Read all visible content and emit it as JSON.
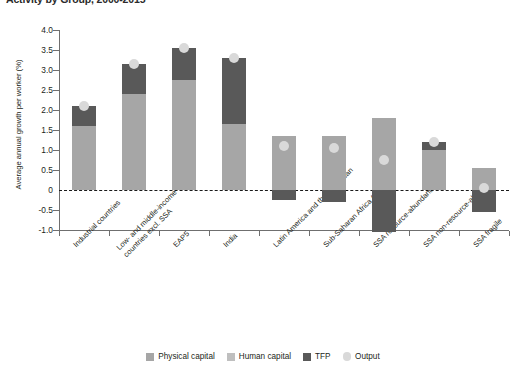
{
  "chart_data": {
    "type": "bar",
    "title": "Activity by Group, 2000-2015",
    "subtitle": "",
    "xlabel": "",
    "ylabel": "Average annual growth per worker (%)",
    "ylim": [
      -1.0,
      4.0
    ],
    "ytick_labels": [
      "4.0",
      "3.5",
      "3.0",
      "2.5",
      "2.0",
      "1.5",
      "1.0",
      "0.5",
      "0",
      "-0.5",
      "-1.0"
    ],
    "ytick_values": [
      4.0,
      3.5,
      3.0,
      2.5,
      2.0,
      1.5,
      1.0,
      0.5,
      0,
      -0.5,
      -1.0
    ],
    "grid": false,
    "zero_line": true,
    "stacked": true,
    "legend_position": "bottom",
    "categories": [
      "Industrial countries",
      "Low- and middle-income countries excl. SSA",
      "EAP5",
      "India",
      "Latin America and the Caribbean",
      "Sub-Saharan Africa (SSA)",
      "SSA resource-abundant",
      "SSA non-resource-abundant",
      "SSA fragile"
    ],
    "category_label_lines": [
      [
        "Industrial countries"
      ],
      [
        "Low- and middle-income",
        "countries excl. SSA"
      ],
      [
        "EAP5"
      ],
      [
        "India"
      ],
      [
        "Latin America and the Caribbean"
      ],
      [
        "Sub-Saharan Africa (SSA)"
      ],
      [
        "SSA resource-abundant"
      ],
      [
        "SSA non-resource-abundant"
      ],
      [
        "SSA fragile"
      ]
    ],
    "series": [
      {
        "name": "Physical capital",
        "color": "#a6a6a6",
        "values": [
          1.6,
          2.4,
          2.75,
          1.65,
          1.35,
          1.35,
          1.8,
          1.0,
          0.55
        ]
      },
      {
        "name": "Human capital",
        "color": "#bfbfbf",
        "values": [
          0,
          0,
          0,
          0,
          0,
          0,
          0,
          0,
          0
        ]
      },
      {
        "name": "TFP",
        "color": "#595959",
        "values": [
          0.5,
          0.75,
          0.8,
          1.65,
          -0.25,
          -0.3,
          -1.05,
          0.2,
          -0.55
        ]
      }
    ],
    "output_marker": {
      "name": "Output",
      "color": "#d9d9d9",
      "values": [
        2.1,
        3.15,
        3.55,
        3.3,
        1.1,
        1.05,
        0.75,
        1.2,
        0.05
      ]
    }
  },
  "legend": {
    "items": [
      {
        "label": "Physical capital",
        "color": "#a6a6a6",
        "shape": "square"
      },
      {
        "label": "Human capital",
        "color": "#bfbfbf",
        "shape": "square"
      },
      {
        "label": "TFP",
        "color": "#595959",
        "shape": "square"
      },
      {
        "label": "Output",
        "color": "#d9d9d9",
        "shape": "circle"
      }
    ]
  }
}
